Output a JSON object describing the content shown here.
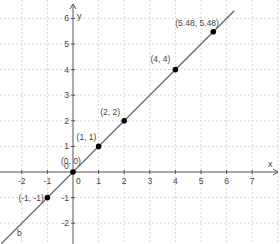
{
  "chart_data": {
    "type": "line",
    "title": "",
    "xlabel": "x",
    "ylabel": "y",
    "xlim": [
      -2.8,
      8.0
    ],
    "ylim": [
      -2.8,
      6.5
    ],
    "grid": true,
    "x_ticks": [
      -2,
      -1,
      0,
      1,
      2,
      3,
      4,
      5,
      6,
      7
    ],
    "y_ticks": [
      -2,
      -1,
      1,
      2,
      3,
      4,
      5,
      6
    ],
    "series": [
      {
        "name": "b",
        "kind": "line",
        "equation": "y = x",
        "color": "#666666",
        "x": [
          -2.8,
          6.3
        ],
        "y": [
          -2.8,
          6.3
        ]
      },
      {
        "name": "points",
        "kind": "scatter",
        "color": "#000000",
        "points": [
          {
            "x": -1,
            "y": -1,
            "label": "(-1, -1)"
          },
          {
            "x": 0,
            "y": 0,
            "label": "(0, 0)"
          },
          {
            "x": 1,
            "y": 1,
            "label": "(1, 1)"
          },
          {
            "x": 2,
            "y": 2,
            "label": "(2, 2)"
          },
          {
            "x": 4,
            "y": 4,
            "label": "(4, 4)"
          },
          {
            "x": 5.48,
            "y": 5.48,
            "label": "(5.48, 5.48)"
          }
        ]
      }
    ],
    "line_label": "b",
    "origin_label": "0"
  }
}
